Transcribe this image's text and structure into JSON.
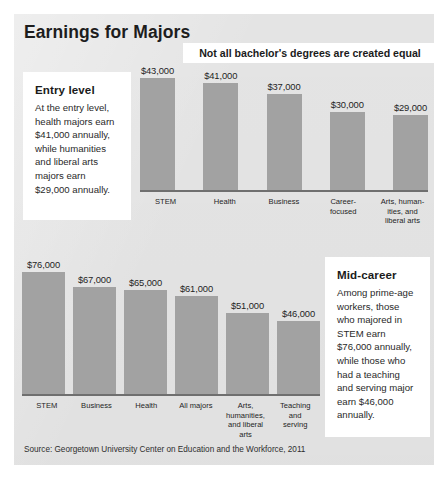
{
  "title": "Earnings for Majors",
  "subtitle": "Not all bachelor's degrees are created equal",
  "source": "Source: Georgetown University Center on Education and the Workforce, 2011",
  "callouts": {
    "entry": {
      "heading": "Entry level",
      "body": "At the entry level, health majors earn $41,000 annually, while humanities and liberal arts majors earn $29,000 annually."
    },
    "mid": {
      "heading": "Mid-career",
      "body": "Among prime-age workers, those who majored in STEM earn $76,000 annually, while those who had a teaching and serving major earn $46,000 annually."
    }
  },
  "chart_data": [
    {
      "type": "bar",
      "id": "entry-level",
      "title": "Not all bachelor's degrees are created equal",
      "xlabel": "",
      "ylabel": "",
      "ylim": [
        0,
        43000
      ],
      "grid": false,
      "legend": "none",
      "categories": [
        "STEM",
        "Health",
        "Business",
        "Career-focused",
        "Arts, humanities, and liberal arts"
      ],
      "category_labels": [
        "STEM",
        "Health",
        "Business",
        "Career-\nfocused",
        "Arts, human-\nities, and\nliberal arts"
      ],
      "values": [
        43000,
        41000,
        37000,
        30000,
        29000
      ],
      "value_labels": [
        "$43,000",
        "$41,000",
        "$37,000",
        "$30,000",
        "$29,000"
      ]
    },
    {
      "type": "bar",
      "id": "mid-career",
      "title": "",
      "xlabel": "",
      "ylabel": "",
      "ylim": [
        0,
        76000
      ],
      "grid": false,
      "legend": "none",
      "categories": [
        "STEM",
        "Business",
        "Health",
        "All majors",
        "Arts, humanities, and liberal arts",
        "Teaching and serving"
      ],
      "category_labels": [
        "STEM",
        "Business",
        "Health",
        "All majors",
        "Arts,\nhumanities,\nand liberal\narts",
        "Teaching\nand\nserving"
      ],
      "values": [
        76000,
        67000,
        65000,
        61000,
        51000,
        46000
      ],
      "value_labels": [
        "$76,000",
        "$67,000",
        "$65,000",
        "$61,000",
        "$51,000",
        "$46,000"
      ]
    }
  ],
  "colors": {
    "bar": "#a2a2a2",
    "panel": "#e4e4e4",
    "axis": "#6f6f6f",
    "text": "#1b1b1b",
    "callout_bg": "#ffffff"
  }
}
